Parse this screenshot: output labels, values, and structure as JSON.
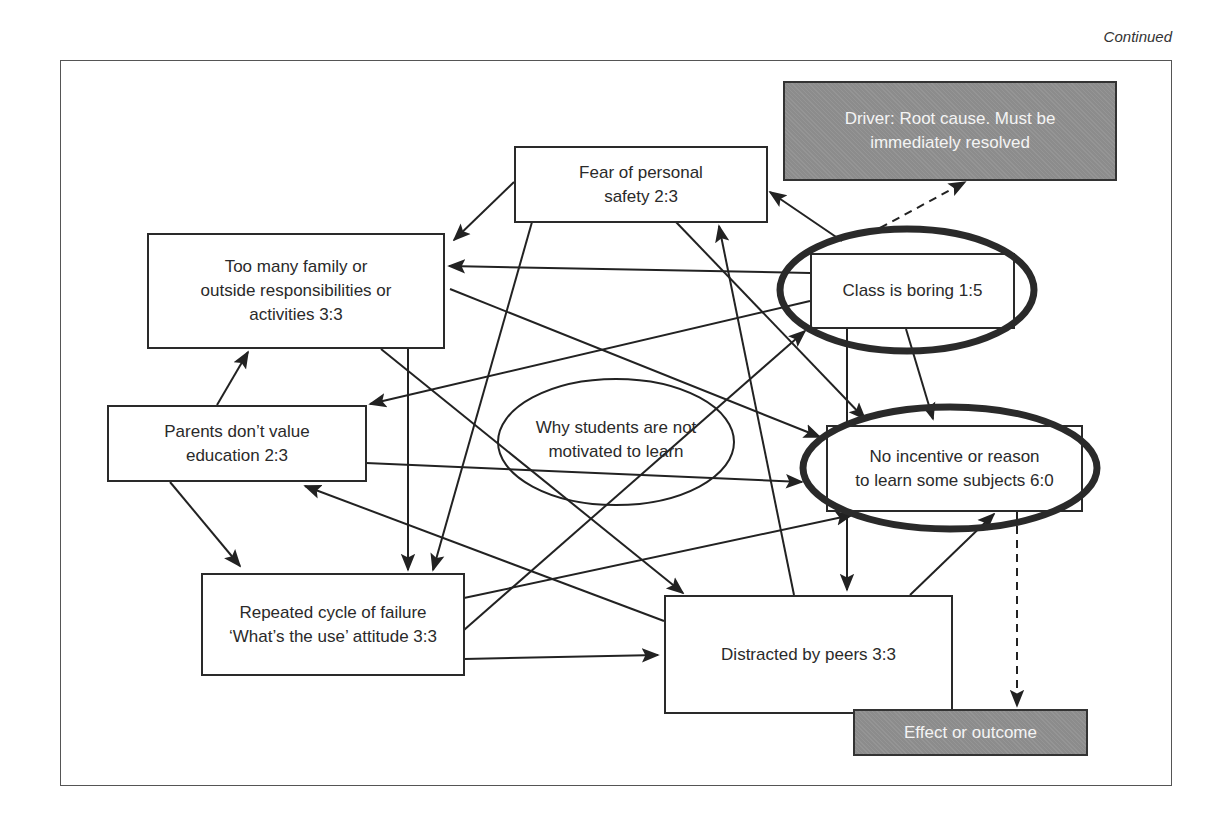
{
  "page": {
    "continued_label": "Continued"
  },
  "diagram": {
    "title_node": {
      "id": "why",
      "label": "Why students are not motivated to learn",
      "shape": "ellipse"
    },
    "legend": {
      "driver": {
        "label": "Driver: Root cause. Must be immediately resolved",
        "fill": "#8c8c8c"
      },
      "outcome": {
        "label": "Effect or outcome",
        "fill": "#8c8c8c"
      }
    },
    "nodes": [
      {
        "id": "fear",
        "label_lines": [
          "Fear of personal",
          "safety 2:3"
        ],
        "in": 2,
        "out": 3
      },
      {
        "id": "family",
        "label_lines": [
          "Too many family or",
          "outside responsibilities or",
          "activities 3:3"
        ],
        "in": 3,
        "out": 3
      },
      {
        "id": "boring",
        "label_lines": [
          "Class is boring  1:5"
        ],
        "in": 1,
        "out": 5,
        "highlight": "driver"
      },
      {
        "id": "parents",
        "label_lines": [
          "Parents don’t value",
          "education 2:3"
        ],
        "in": 2,
        "out": 3
      },
      {
        "id": "incentive",
        "label_lines": [
          "No incentive or reason",
          "to learn some subjects 6:0"
        ],
        "in": 6,
        "out": 0,
        "highlight": "outcome"
      },
      {
        "id": "failure",
        "label_lines": [
          "Repeated cycle of failure",
          "‘What’s the use’ attitude 3:3"
        ],
        "in": 3,
        "out": 3
      },
      {
        "id": "peers",
        "label_lines": [
          "Distracted by peers 3:3"
        ],
        "in": 3,
        "out": 3
      }
    ],
    "edges": [
      {
        "from": "fear",
        "to": "family"
      },
      {
        "from": "fear",
        "to": "failure"
      },
      {
        "from": "fear",
        "to": "incentive"
      },
      {
        "from": "boring",
        "to": "fear"
      },
      {
        "from": "boring",
        "to": "family"
      },
      {
        "from": "boring",
        "to": "parents"
      },
      {
        "from": "boring",
        "to": "incentive"
      },
      {
        "from": "boring",
        "to": "peers"
      },
      {
        "from": "family",
        "to": "incentive"
      },
      {
        "from": "family",
        "to": "failure"
      },
      {
        "from": "family",
        "to": "peers"
      },
      {
        "from": "parents",
        "to": "family"
      },
      {
        "from": "parents",
        "to": "failure"
      },
      {
        "from": "parents",
        "to": "incentive"
      },
      {
        "from": "failure",
        "to": "boring"
      },
      {
        "from": "failure",
        "to": "incentive"
      },
      {
        "from": "failure",
        "to": "peers"
      },
      {
        "from": "peers",
        "to": "fear"
      },
      {
        "from": "peers",
        "to": "parents"
      },
      {
        "from": "peers",
        "to": "incentive"
      }
    ],
    "legend_links": [
      {
        "from": "boring",
        "to": "driver",
        "style": "dashed"
      },
      {
        "from": "incentive",
        "to": "outcome",
        "style": "dashed"
      }
    ]
  }
}
